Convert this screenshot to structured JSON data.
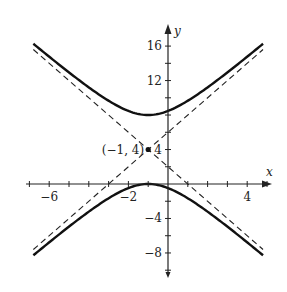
{
  "chart_data": {
    "type": "line",
    "title": "",
    "xlabel": "x",
    "ylabel": "y",
    "xlim": [
      -7,
      5
    ],
    "ylim": [
      -10,
      18
    ],
    "grid": false,
    "x_ticks": [
      -7,
      -6,
      -5,
      -4,
      -3,
      -2,
      -1,
      0,
      1,
      2,
      3,
      4,
      5
    ],
    "x_tick_labels": [
      {
        "value": -6,
        "label": "−6"
      },
      {
        "value": -2,
        "label": "−2"
      },
      {
        "value": 4,
        "label": "4"
      }
    ],
    "y_ticks": [
      -10,
      -8,
      -6,
      -4,
      -2,
      2,
      4,
      6,
      8,
      10,
      12,
      14,
      16
    ],
    "y_tick_labels": [
      {
        "value": 16,
        "label": "16"
      },
      {
        "value": 12,
        "label": "12"
      },
      {
        "value": 4,
        "label": "4"
      },
      {
        "value": -4,
        "label": "−4"
      },
      {
        "value": -8,
        "label": "−8"
      }
    ],
    "series": [
      {
        "name": "hyperbola-upper-branch",
        "style": "solid",
        "equation": "(y-4)^2/16 - (x+1)^2/4 = 1",
        "branch": "upper",
        "x_range": [
          -6.8,
          4.8
        ]
      },
      {
        "name": "hyperbola-lower-branch",
        "style": "solid",
        "equation": "(y-4)^2/16 - (x+1)^2/4 = 1",
        "branch": "lower",
        "x_range": [
          -6.8,
          4.8
        ]
      },
      {
        "name": "asymptote-positive",
        "style": "dashed",
        "equation": "y = 2x + 6",
        "x_range": [
          -6.8,
          4.8
        ]
      },
      {
        "name": "asymptote-negative",
        "style": "dashed",
        "equation": "y = -2x + 2",
        "x_range": [
          -6.8,
          4.8
        ]
      }
    ],
    "points": [
      {
        "x": -1,
        "y": 4,
        "label": "(−1, 4)"
      }
    ],
    "center": {
      "x": -1,
      "y": 4
    },
    "vertices": [
      {
        "x": -1,
        "y": 8
      },
      {
        "x": -1,
        "y": 0
      }
    ],
    "annotations": [
      "(−1, 4)"
    ]
  },
  "colors": {
    "curve": "#111111",
    "axis": "#222222",
    "asymptote": "#222222"
  }
}
